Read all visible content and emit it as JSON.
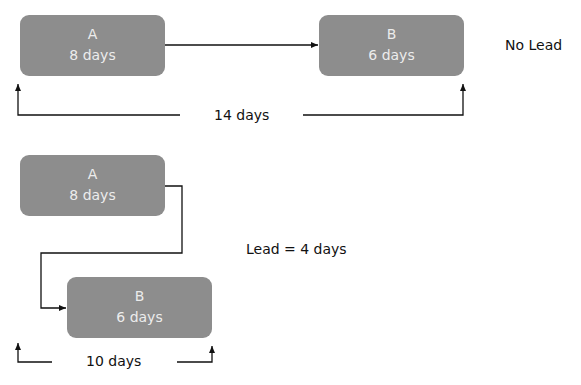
{
  "diagram": {
    "no_lead": {
      "task_a": {
        "name": "A",
        "duration": "8 days"
      },
      "task_b": {
        "name": "B",
        "duration": "6 days"
      },
      "total_label": "14 days",
      "caption": "No Lead"
    },
    "with_lead": {
      "task_a": {
        "name": "A",
        "duration": "8 days"
      },
      "task_b": {
        "name": "B",
        "duration": "6 days"
      },
      "total_label": "10 days",
      "caption": "Lead = 4 days"
    },
    "colors": {
      "box_fill": "#8d8d8d",
      "box_text": "#ececec",
      "line": "#111111"
    }
  }
}
